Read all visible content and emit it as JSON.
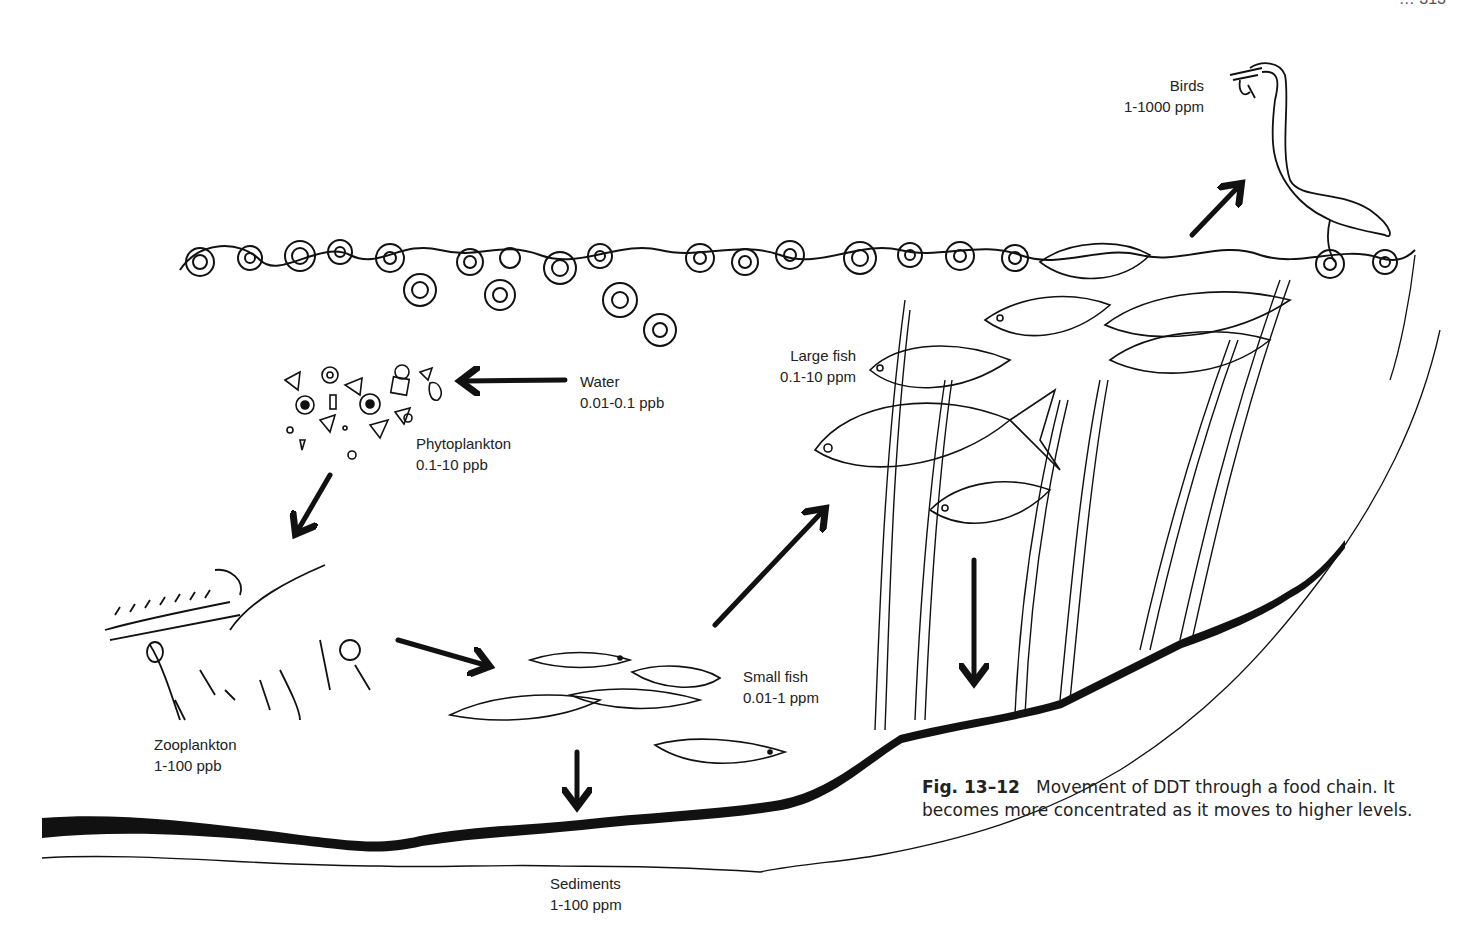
{
  "page_header": "… 313",
  "labels": {
    "birds": {
      "name": "Birds",
      "value": "1-1000 ppm"
    },
    "water": {
      "name": "Water",
      "value": "0.01-0.1 ppb"
    },
    "phytoplankton": {
      "name": "Phytoplankton",
      "value": "0.1-10 ppb"
    },
    "zooplankton": {
      "name": "Zooplankton",
      "value": "1-100 ppb"
    },
    "small_fish": {
      "name": "Small fish",
      "value": "0.01-1 ppm"
    },
    "large_fish": {
      "name": "Large fish",
      "value": "0.1-10 ppm"
    },
    "sediments": {
      "name": "Sediments",
      "value": "1-100 ppm"
    }
  },
  "caption": {
    "fig_number": "Fig. 13–12",
    "text": "Movement of DDT through a food chain. It becomes more concentrated as it moves to higher levels."
  },
  "flow": [
    {
      "from": "Water",
      "to": "Phytoplankton"
    },
    {
      "from": "Phytoplankton",
      "to": "Zooplankton"
    },
    {
      "from": "Zooplankton",
      "to": "Small fish"
    },
    {
      "from": "Small fish",
      "to": "Large fish"
    },
    {
      "from": "Large fish",
      "to": "Birds"
    },
    {
      "from": "Small fish",
      "to": "Sediments"
    },
    {
      "from": "Large fish",
      "to": "Sediments"
    }
  ]
}
